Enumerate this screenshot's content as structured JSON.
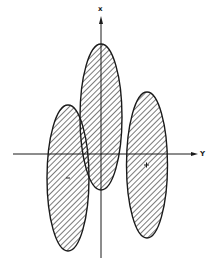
{
  "figure": {
    "type": "diagram",
    "axes": {
      "vertical_label": "x",
      "horizontal_label": "Y"
    },
    "ellipses": [
      {
        "name": "center",
        "cx": 101,
        "cy": 117,
        "rx": 21,
        "ry": 73,
        "marker": false
      },
      {
        "name": "left",
        "cx": 68,
        "cy": 178,
        "rx": 21,
        "ry": 73,
        "marker": true
      },
      {
        "name": "right",
        "cx": 147,
        "cy": 165,
        "rx": 20.5,
        "ry": 73,
        "marker": true
      }
    ],
    "colors": {
      "stroke": "#1a1a1a",
      "hatch": "#333333",
      "background": "#ffffff"
    }
  }
}
